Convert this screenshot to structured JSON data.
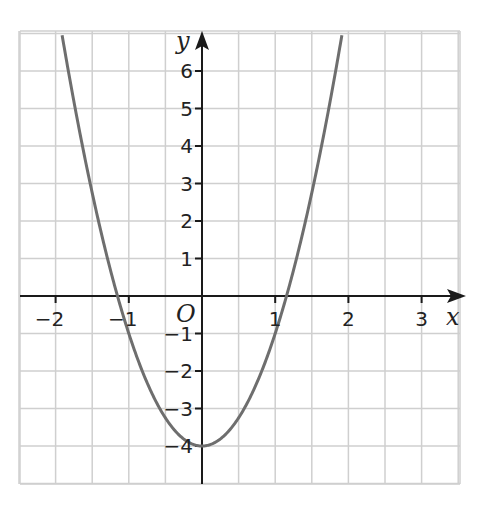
{
  "chart_data": {
    "type": "line",
    "title": "",
    "function": "y = 3x^2 - 4",
    "xlabel": "x",
    "ylabel": "y",
    "origin_label": "O",
    "xlim": [
      -2.5,
      3.5
    ],
    "ylim": [
      -5,
      7
    ],
    "grid": true,
    "x_ticks": [
      -2,
      -1,
      1,
      2,
      3
    ],
    "x_tick_labels": [
      "−2",
      "−1",
      "1",
      "2",
      "3"
    ],
    "y_ticks": [
      -4,
      -3,
      -2,
      -1,
      1,
      2,
      3,
      4,
      5,
      6
    ],
    "y_tick_labels": [
      "−4",
      "−3",
      "−2",
      "−1",
      "1",
      "2",
      "3",
      "4",
      "5",
      "6"
    ],
    "series": [
      {
        "name": "parabola",
        "x": [
          -2,
          -1.5,
          -1.155,
          -1,
          -0.5,
          0,
          0.5,
          1,
          1.155,
          1.5,
          2
        ],
        "y": [
          8,
          2.75,
          0,
          -1,
          -3.25,
          -4,
          -3.25,
          -1,
          0,
          2.75,
          8
        ]
      }
    ],
    "key_points": {
      "vertex": [
        0,
        -4
      ],
      "x_intercepts": [
        -1.155,
        1.155
      ]
    },
    "colors": {
      "curve": "#6e6e6e",
      "grid": "#cfcfcf",
      "axes": "#1a1a1a"
    }
  }
}
